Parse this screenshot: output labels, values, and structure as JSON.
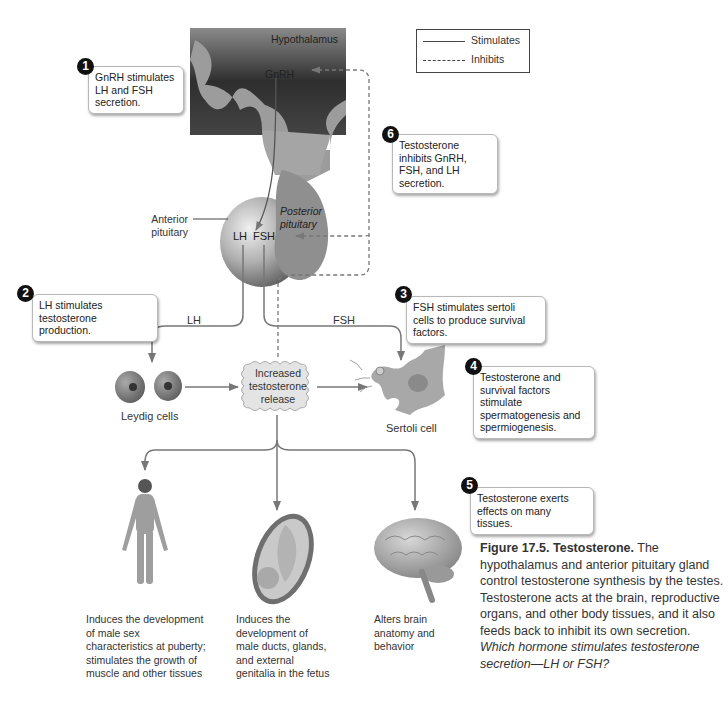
{
  "legend": {
    "stimulates": "Stimulates",
    "inhibits": "Inhibits"
  },
  "anatomy": {
    "hypothalamus": "Hypothalamus",
    "gnrh": "GnRH",
    "anterior_pituitary_line1": "Anterior",
    "anterior_pituitary_line2": "pituitary",
    "posterior_pituitary_line1": "Posterior",
    "posterior_pituitary_line2": "pituitary",
    "lh": "LH",
    "fsh": "FSH",
    "lh_arrow": "LH",
    "fsh_arrow": "FSH",
    "leydig": "Leydig cells",
    "sertoli": "Sertoli cell",
    "release_line1": "Increased",
    "release_line2": "testosterone",
    "release_line3": "release"
  },
  "steps": [
    {
      "num": "1",
      "text": "GnRH stimulates LH and FSH secretion."
    },
    {
      "num": "2",
      "text": "LH stimulates testosterone production."
    },
    {
      "num": "3",
      "text": "FSH stimulates sertoli cells to produce survival factors."
    },
    {
      "num": "4",
      "text": "Testosterone and survival factors stimulate spermatogenesis and spermiogenesis."
    },
    {
      "num": "5",
      "text": "Testosterone exerts effects on many tissues."
    },
    {
      "num": "6",
      "text": "Testosterone inhibits GnRH, FSH, and LH secretion."
    }
  ],
  "effects": [
    {
      "text": "Induces the development of male sex characteristics at puberty; stimulates the growth of muscle and other tissues"
    },
    {
      "text": "Induces the development of male ducts, glands, and external genitalia in the fetus"
    },
    {
      "text": "Alters brain anatomy and behavior"
    }
  ],
  "caption": {
    "figure_label": "Figure 17.5.",
    "title": "Testosterone.",
    "body": "The hypothalamus and anterior pituitary gland control testosterone synthesis by the testes. Testosterone acts at the brain, reproductive organs, and other body tissues, and it also feeds back to inhibit its own secretion.",
    "question": "Which hormone stimulates testosterone secretion—LH or FSH?"
  }
}
